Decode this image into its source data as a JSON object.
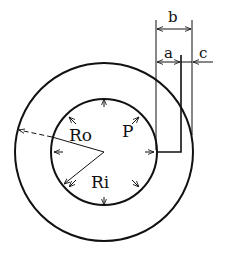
{
  "diagram": {
    "type": "pressurized annular ring cross-section",
    "labels": {
      "outer_radius": "Ro",
      "inner_radius": "Ri",
      "pressure": "P",
      "dim_a": "a",
      "dim_b": "b",
      "dim_c": "c"
    },
    "colors": {
      "stroke": "#111111",
      "background": "#ffffff"
    },
    "geometry": {
      "center": [
        104,
        152
      ],
      "outer_radius_px": 89,
      "inner_radius_px": 53,
      "pressure_arrow_count": 8
    }
  }
}
